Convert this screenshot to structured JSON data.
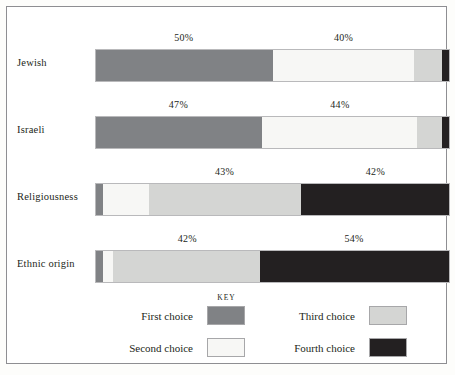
{
  "key": {
    "title": "KEY",
    "entries": [
      {
        "label": "First choice",
        "color": "#808285"
      },
      {
        "label": "Second choice",
        "color": "#f7f7f5"
      },
      {
        "label": "Third choice",
        "color": "#d4d5d3"
      },
      {
        "label": "Fourth choice",
        "color": "#232021"
      }
    ]
  },
  "chart_data": {
    "type": "bar",
    "orientation": "horizontal",
    "stacked": true,
    "title": "",
    "xlabel": "",
    "ylabel": "",
    "xlim": [
      0,
      100
    ],
    "grid": false,
    "legend_position": "bottom",
    "categories": [
      "Jewish",
      "Israeli",
      "Religiousness",
      "Ethnic origin"
    ],
    "series": [
      {
        "name": "First choice",
        "color": "#808285",
        "values": [
          50,
          47,
          2,
          2
        ]
      },
      {
        "name": "Second choice",
        "color": "#f7f7f5",
        "values": [
          40,
          44,
          13,
          3
        ]
      },
      {
        "name": "Third choice",
        "color": "#d4d5d3",
        "values": [
          8,
          7,
          43,
          42
        ]
      },
      {
        "name": "Fourth choice",
        "color": "#232021",
        "values": [
          2,
          2,
          42,
          54
        ]
      }
    ],
    "annotations": [
      {
        "category": "Jewish",
        "text": "50%",
        "series": "First choice",
        "center_pct": 25
      },
      {
        "category": "Jewish",
        "text": "40%",
        "series": "Second choice",
        "center_pct": 70
      },
      {
        "category": "Israeli",
        "text": "47%",
        "series": "First choice",
        "center_pct": 23.5
      },
      {
        "category": "Israeli",
        "text": "44%",
        "series": "Second choice",
        "center_pct": 69
      },
      {
        "category": "Religiousness",
        "text": "43%",
        "series": "Third choice",
        "center_pct": 36.5
      },
      {
        "category": "Religiousness",
        "text": "42%",
        "series": "Fourth choice",
        "center_pct": 79
      },
      {
        "category": "Ethnic origin",
        "text": "42%",
        "series": "Third choice",
        "center_pct": 26
      },
      {
        "category": "Ethnic origin",
        "text": "54%",
        "series": "Fourth choice",
        "center_pct": 73
      }
    ]
  },
  "rows": [
    {
      "label": "Jewish",
      "segments": [
        {
          "name": "First choice",
          "pct": 50
        },
        {
          "name": "Second choice",
          "pct": 40
        },
        {
          "name": "Third choice",
          "pct": 8
        },
        {
          "name": "Fourth choice",
          "pct": 2
        }
      ],
      "labels": [
        {
          "text": "50%",
          "pos": 25
        },
        {
          "text": "40%",
          "pos": 70
        }
      ]
    },
    {
      "label": "Israeli",
      "segments": [
        {
          "name": "First choice",
          "pct": 47
        },
        {
          "name": "Second choice",
          "pct": 44
        },
        {
          "name": "Third choice",
          "pct": 7
        },
        {
          "name": "Fourth choice",
          "pct": 2
        }
      ],
      "labels": [
        {
          "text": "47%",
          "pos": 23.5
        },
        {
          "text": "44%",
          "pos": 69
        }
      ]
    },
    {
      "label": "Religiousness",
      "segments": [
        {
          "name": "First choice",
          "pct": 2
        },
        {
          "name": "Second choice",
          "pct": 13
        },
        {
          "name": "Third choice",
          "pct": 43
        },
        {
          "name": "Fourth choice",
          "pct": 42
        }
      ],
      "labels": [
        {
          "text": "43%",
          "pos": 36.5
        },
        {
          "text": "42%",
          "pos": 79
        }
      ]
    },
    {
      "label": "Ethnic origin",
      "segments": [
        {
          "name": "First choice",
          "pct": 2
        },
        {
          "name": "Second choice",
          "pct": 3
        },
        {
          "name": "Third choice",
          "pct": 42
        },
        {
          "name": "Fourth choice",
          "pct": 54
        }
      ],
      "labels": [
        {
          "text": "42%",
          "pos": 26
        },
        {
          "text": "54%",
          "pos": 73
        }
      ]
    }
  ]
}
